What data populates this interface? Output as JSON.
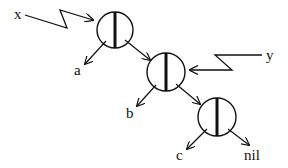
{
  "diagram": {
    "stroke_color": "#111111",
    "background": "#ffffff",
    "nodes": [
      {
        "id": "node1",
        "cx": 115,
        "cy": 30,
        "r": 18
      },
      {
        "id": "node2",
        "cx": 166,
        "cy": 72,
        "r": 19
      },
      {
        "id": "node3",
        "cx": 217,
        "cy": 117,
        "r": 19
      }
    ],
    "labels": {
      "x": "x",
      "y": "y",
      "a": "a",
      "b": "b",
      "c": "c",
      "nil": "nil"
    },
    "pointers": {
      "x_pointer": "25,15 67,28 60,10 93,20",
      "y_pointer": "262,55 215,55 232,70 190,70"
    },
    "edges": [
      {
        "name": "edge-node1-to-a",
        "x1": 106,
        "y1": 41,
        "x2": 85,
        "y2": 64
      },
      {
        "name": "edge-node1-to-node2",
        "x1": 125,
        "y1": 40,
        "x2": 150,
        "y2": 60
      },
      {
        "name": "edge-node2-to-b",
        "x1": 156,
        "y1": 85,
        "x2": 137,
        "y2": 106
      },
      {
        "name": "edge-node2-to-node3",
        "x1": 176,
        "y1": 84,
        "x2": 200,
        "y2": 104
      },
      {
        "name": "edge-node3-to-c",
        "x1": 207,
        "y1": 129,
        "x2": 187,
        "y2": 149
      },
      {
        "name": "edge-node3-to-nil",
        "x1": 228,
        "y1": 129,
        "x2": 249,
        "y2": 145
      }
    ]
  }
}
